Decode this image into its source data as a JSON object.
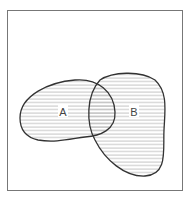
{
  "diagram": {
    "type": "venn",
    "universe": {
      "label": ""
    },
    "sets": [
      {
        "id": "A",
        "label": "A",
        "shaded": true
      },
      {
        "id": "B",
        "label": "B",
        "shaded": true
      }
    ],
    "shaded_region": "A ∪ B",
    "shading_style": "horizontal-lines",
    "colors": {
      "outline": "#333333",
      "frame": "#777777",
      "hatch": "#aaaaaa",
      "background": "#ffffff"
    }
  }
}
